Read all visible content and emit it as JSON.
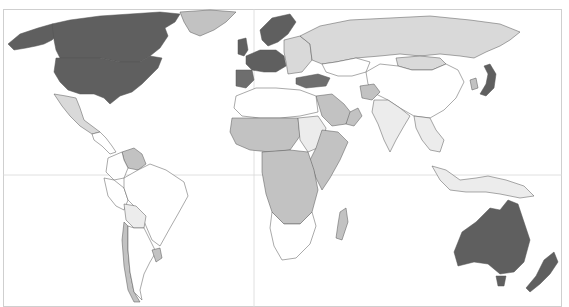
{
  "map": {
    "type": "choropleth",
    "projection": "world",
    "palette": {
      "none": "#ffffff",
      "very_light": "#ececec",
      "light": "#d9d9d9",
      "medium": "#c2c2c2",
      "dark": "#6e6e6e",
      "darker": "#5f5f5f"
    },
    "frame_color": "#cfcfcf",
    "grid_color": "#d8d8d8",
    "regions": [
      {
        "name": "Canada",
        "shade": "darker"
      },
      {
        "name": "United States",
        "shade": "darker"
      },
      {
        "name": "Alaska (US)",
        "shade": "darker"
      },
      {
        "name": "Greenland",
        "shade": "medium"
      },
      {
        "name": "Mexico",
        "shade": "light"
      },
      {
        "name": "Central America",
        "shade": "none"
      },
      {
        "name": "Venezuela",
        "shade": "medium"
      },
      {
        "name": "Colombia",
        "shade": "none"
      },
      {
        "name": "Brazil",
        "shade": "none"
      },
      {
        "name": "Peru",
        "shade": "none"
      },
      {
        "name": "Bolivia",
        "shade": "very_light"
      },
      {
        "name": "Chile",
        "shade": "medium"
      },
      {
        "name": "Argentina",
        "shade": "none"
      },
      {
        "name": "Uruguay",
        "shade": "medium"
      },
      {
        "name": "Western Europe",
        "shade": "darker"
      },
      {
        "name": "Scandinavia",
        "shade": "darker"
      },
      {
        "name": "United Kingdom",
        "shade": "darker"
      },
      {
        "name": "Iberia",
        "shade": "dark"
      },
      {
        "name": "Eastern Europe",
        "shade": "light"
      },
      {
        "name": "Russia",
        "shade": "light"
      },
      {
        "name": "Kazakhstan",
        "shade": "none"
      },
      {
        "name": "Mongolia",
        "shade": "light"
      },
      {
        "name": "China",
        "shade": "none"
      },
      {
        "name": "Japan",
        "shade": "darker"
      },
      {
        "name": "South Korea",
        "shade": "medium"
      },
      {
        "name": "India",
        "shade": "very_light"
      },
      {
        "name": "Afghanistan",
        "shade": "medium"
      },
      {
        "name": "Saudi Arabia",
        "shade": "medium"
      },
      {
        "name": "Oman",
        "shade": "dark"
      },
      {
        "name": "Turkey",
        "shade": "medium"
      },
      {
        "name": "Southeast Asia",
        "shade": "very_light"
      },
      {
        "name": "Indonesia",
        "shade": "very_light"
      },
      {
        "name": "Australia",
        "shade": "darker"
      },
      {
        "name": "New Zealand",
        "shade": "darker"
      },
      {
        "name": "North Africa",
        "shade": "none"
      },
      {
        "name": "Sahel",
        "shade": "medium"
      },
      {
        "name": "Sudan",
        "shade": "very_light"
      },
      {
        "name": "Central Africa",
        "shade": "medium"
      },
      {
        "name": "East Africa",
        "shade": "medium"
      },
      {
        "name": "Southern Africa",
        "shade": "none"
      },
      {
        "name": "Madagascar",
        "shade": "medium"
      }
    ]
  }
}
